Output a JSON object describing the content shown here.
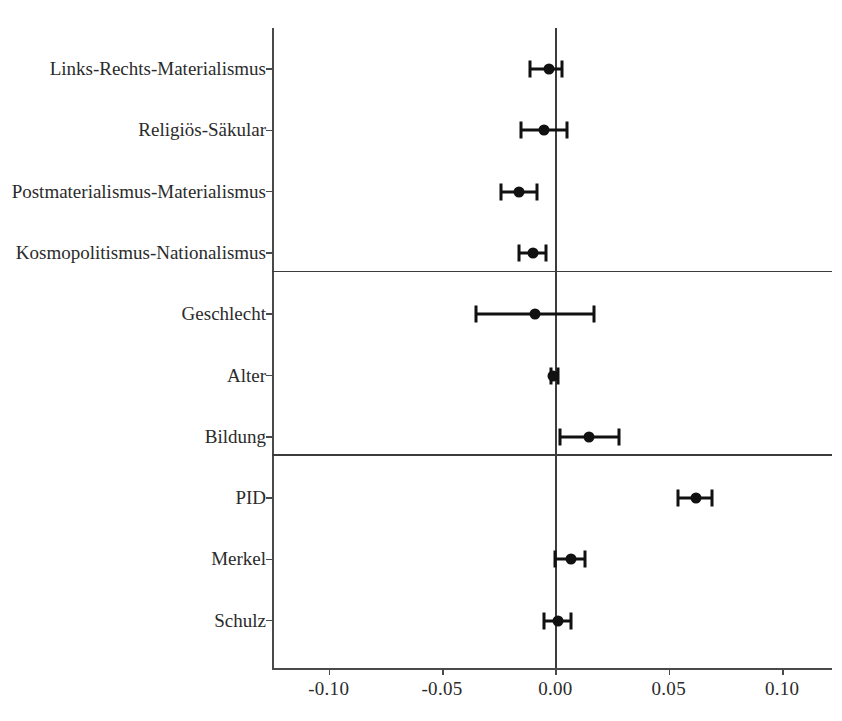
{
  "chart_data": {
    "type": "scatter",
    "subtype": "coefficient-plot-with-error-bars",
    "title": "",
    "xlabel": "",
    "ylabel": "",
    "xlim": [
      -0.125,
      0.122
    ],
    "xticks": [
      -0.1,
      -0.05,
      0.0,
      0.05,
      0.1
    ],
    "xticklabels": [
      "-0.10",
      "-0.05",
      "0.00",
      "0.05",
      "0.10"
    ],
    "grid": false,
    "legend": null,
    "reference_line_x": 0.0,
    "group_separators_after": [
      "Kosmopolitismus-Nationalismus",
      "Bildung"
    ],
    "categories": [
      "Links-Rechts-Materialismus",
      "Religiös-Säkular",
      "Postmaterialismus-Materialismus",
      "Kosmopolitismus-Nationalismus",
      "Geschlecht",
      "Alter",
      "Bildung",
      "PID",
      "Merkel",
      "Schulz"
    ],
    "points": [
      {
        "label": "Links-Rechts-Materialismus",
        "estimate": -0.003,
        "ci_low": -0.011,
        "ci_high": 0.003
      },
      {
        "label": "Religiös-Säkular",
        "estimate": -0.005,
        "ci_low": -0.015,
        "ci_high": 0.005
      },
      {
        "label": "Postmaterialismus-Materialismus",
        "estimate": -0.016,
        "ci_low": -0.024,
        "ci_high": -0.008
      },
      {
        "label": "Kosmopolitismus-Nationalismus",
        "estimate": -0.01,
        "ci_low": -0.016,
        "ci_high": -0.004
      },
      {
        "label": "Geschlecht",
        "estimate": -0.009,
        "ci_low": -0.035,
        "ci_high": 0.017
      },
      {
        "label": "Alter",
        "estimate": -0.001,
        "ci_low": -0.002,
        "ci_high": 0.001
      },
      {
        "label": "Bildung",
        "estimate": 0.015,
        "ci_low": 0.002,
        "ci_high": 0.028
      },
      {
        "label": "PID",
        "estimate": 0.062,
        "ci_low": 0.054,
        "ci_high": 0.069
      },
      {
        "label": "Merkel",
        "estimate": 0.007,
        "ci_low": 0.0,
        "ci_high": 0.013
      },
      {
        "label": "Schulz",
        "estimate": 0.001,
        "ci_low": -0.005,
        "ci_high": 0.007
      }
    ]
  },
  "colors": {
    "point": "#111111",
    "axis": "#4a4a4a",
    "reference": "#3c3c3c",
    "background": "#ffffff"
  }
}
